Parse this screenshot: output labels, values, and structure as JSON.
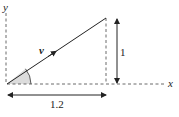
{
  "diagram": {
    "axes": {
      "x_label": "x",
      "y_label": "y"
    },
    "vector": {
      "label": "v",
      "from": [
        0,
        0
      ],
      "to": [
        1.2,
        1
      ]
    },
    "dimensions": {
      "horizontal_label": "1.2",
      "vertical_label": "1"
    },
    "angle": {
      "shaded": true,
      "fill": "#dcdcdc"
    },
    "colors": {
      "line": "#222222",
      "dashed": "#444444"
    }
  }
}
